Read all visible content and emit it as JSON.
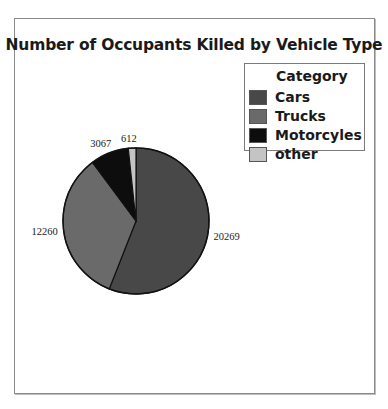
{
  "chart": {
    "title": "Number of Occupants Killed by Vehicle Type",
    "legend": {
      "title": "Category",
      "items": [
        {
          "label": "Cars",
          "color": "#484848"
        },
        {
          "label": "Trucks",
          "color": "#6a6a6a"
        },
        {
          "label": "Motorcyles",
          "color": "#0d0d0d"
        },
        {
          "label": "other",
          "color": "#c4c4c4"
        }
      ]
    }
  },
  "chart_data": {
    "type": "pie",
    "title": "Number of Occupants Killed by Vehicle Type",
    "legend_title": "Category",
    "legend_position": "upper right",
    "categories": [
      "Cars",
      "Trucks",
      "Motorcyles",
      "other"
    ],
    "values": [
      20269,
      12260,
      3067,
      612
    ],
    "colors": [
      "#484848",
      "#6a6a6a",
      "#0d0d0d",
      "#c4c4c4"
    ],
    "labels": [
      "20269",
      "12260",
      "3067",
      "612"
    ],
    "start_angle": "12 o'clock",
    "direction": "clockwise"
  }
}
